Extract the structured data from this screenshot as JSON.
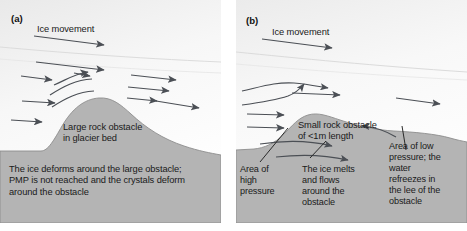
{
  "figure": {
    "colors": {
      "bedrock": "#b4b4b4",
      "ice_top": "#f2f2f2",
      "ice_bottom": "#ffffff",
      "arrow": "#4b4f55",
      "text": "#1a1a1a",
      "page": "#ffffff"
    }
  },
  "panels": [
    {
      "id": "a",
      "label": "(a)",
      "ice_movement_label": "Ice movement",
      "obstacle_label": "Large rock obstacle\nin glacier bed",
      "caption": "The ice deforms around the large obstacle;\nPMP is not reached and the crystals deform\naround the obstacle",
      "flow_arrow_count": 11,
      "obstacle_type": "large",
      "mechanism": "plastic deformation"
    },
    {
      "id": "b",
      "label": "(b)",
      "ice_movement_label": "Ice movement",
      "obstacle_label": "Small rock obstacle\nof <1m length",
      "annotations": [
        {
          "name": "high-pressure",
          "text": "Area of\nhigh\npressure"
        },
        {
          "name": "melt-flow",
          "text": "The ice melts\nand flows\naround the\nobstacle"
        },
        {
          "name": "low-pressure",
          "text": "Area of low\npressure; the\nwater\nrefreezes in\nthe lee of the\nobstacle"
        }
      ],
      "flow_arrow_count": 7,
      "obstacle_type": "small",
      "mechanism": "regelation"
    }
  ]
}
